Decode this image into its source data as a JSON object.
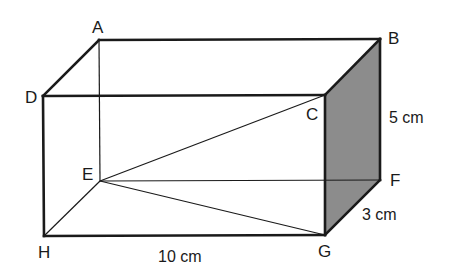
{
  "figure": {
    "type": "rectangular prism (cuboid)",
    "colors": {
      "edge": "#1a1a1a",
      "shaded_face": "#8c8c8c",
      "background": "#ffffff"
    },
    "vertices": {
      "A": {
        "label": "A",
        "x": 99,
        "y": 40
      },
      "B": {
        "label": "B",
        "x": 380,
        "y": 39
      },
      "C": {
        "label": "C",
        "x": 325,
        "y": 95
      },
      "D": {
        "label": "D",
        "x": 43,
        "y": 96
      },
      "E": {
        "label": "E",
        "x": 100,
        "y": 181
      },
      "F": {
        "label": "F",
        "x": 380,
        "y": 180
      },
      "G": {
        "label": "G",
        "x": 325,
        "y": 235
      },
      "H": {
        "label": "H",
        "x": 44,
        "y": 236
      }
    },
    "shaded_face": [
      "C",
      "B",
      "F",
      "G"
    ],
    "hidden_edges": [
      "AE",
      "EF",
      "EH"
    ],
    "diagonals": [
      "EC",
      "EG"
    ],
    "dimensions": {
      "length": "10 cm",
      "height": "5 cm",
      "width": "3 cm"
    }
  }
}
